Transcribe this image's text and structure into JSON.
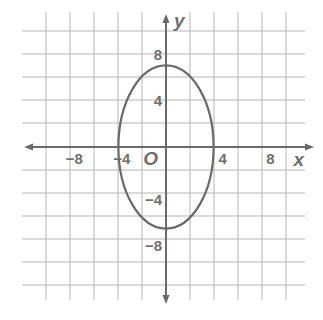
{
  "chart_data": {
    "type": "line",
    "title": "",
    "xlabel": "x",
    "ylabel": "y",
    "origin_label": "O",
    "xlim": [
      -12,
      10
    ],
    "ylim": [
      -12,
      12
    ],
    "grid": true,
    "grid_step": 2,
    "x_ticks": [
      -8,
      -4,
      4,
      8
    ],
    "y_ticks": [
      8,
      4,
      -4,
      -8
    ],
    "x_tick_labels": [
      "−8",
      "−4",
      "4",
      "8"
    ],
    "y_tick_labels": [
      "8",
      "4",
      "−4",
      "−8"
    ],
    "series": [
      {
        "name": "ellipse",
        "shape": "ellipse",
        "center": [
          0,
          0
        ],
        "semi_axis_x": 4,
        "semi_axis_y": 7,
        "equation": "x^2/16 + y^2/49 = 1",
        "x_intercepts": [
          -4,
          4
        ],
        "y_intercepts": [
          7,
          -7
        ]
      }
    ],
    "colors": {
      "grid": "#b5b5b5",
      "axis": "#6a6a6a",
      "curve": "#6a6a6a",
      "text": "#6f6f6f"
    }
  },
  "layout": {
    "origin_px": [
      166,
      147
    ],
    "px_per_unit_x": 11.9,
    "px_per_unit_y": 11.65,
    "grid_x_px": [
      46,
      70,
      94,
      118,
      142,
      190,
      214,
      238,
      262,
      286
    ],
    "grid_y_px": [
      31,
      54,
      77,
      100,
      123,
      170,
      193,
      216,
      239,
      262,
      285
    ],
    "grid_x_extent": [
      22,
      305
    ],
    "grid_y_extent": [
      12,
      300
    ]
  }
}
